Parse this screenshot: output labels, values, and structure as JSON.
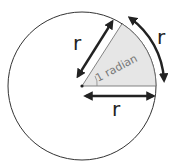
{
  "diagram": {
    "labels": {
      "radius_slanted": "r",
      "radius_horizontal": "r",
      "arc": "r",
      "angle": "1 radian"
    },
    "colors": {
      "sector_fill": "#e6e6e6",
      "stroke": "#222222",
      "angle_text": "#777777"
    }
  }
}
